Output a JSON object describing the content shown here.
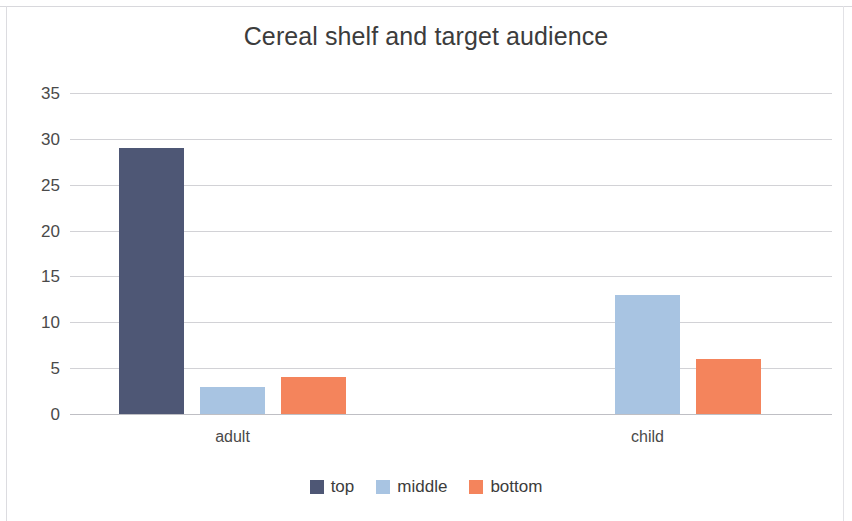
{
  "chart_data": {
    "type": "bar",
    "title": "Cereal shelf and target audience",
    "xlabel": "",
    "ylabel": "",
    "categories": [
      "adult",
      "child"
    ],
    "series": [
      {
        "name": "top",
        "values": [
          29,
          0
        ],
        "color": "#4e5775"
      },
      {
        "name": "middle",
        "values": [
          3,
          13
        ],
        "color": "#a8c4e2"
      },
      {
        "name": "bottom",
        "values": [
          4,
          6
        ],
        "color": "#f4845c"
      }
    ],
    "ylim": [
      0,
      35
    ],
    "yticks": [
      "35",
      "30",
      "25",
      "20",
      "15",
      "10",
      "5",
      "0"
    ],
    "ytick_values": [
      35,
      30,
      25,
      20,
      15,
      10,
      5,
      0
    ],
    "grid": true,
    "grid_color": "#d2d2d6",
    "legend_position": "bottom",
    "background": "#ffffff",
    "text_color": "#3c3c3c"
  }
}
